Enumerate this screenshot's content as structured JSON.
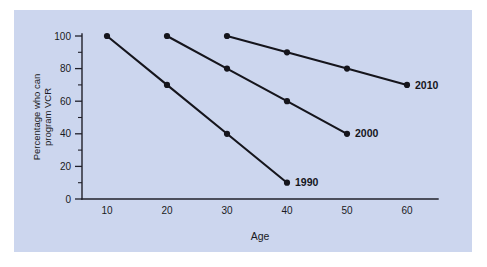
{
  "figure": {
    "panel_color": "#ccd6ee",
    "page_color": "#ffffff",
    "ink_color": "#15151c"
  },
  "chart_data": {
    "type": "line",
    "title": "",
    "xlabel": "Age",
    "ylabel": "Percentage who can program VCR",
    "ylabel_line1": "Percentage who can",
    "ylabel_line2": "program VCR",
    "xlim": [
      0,
      65
    ],
    "ylim": [
      0,
      100
    ],
    "xticks": [
      10,
      20,
      30,
      40,
      50,
      60
    ],
    "xtick_labels": [
      "10",
      "20",
      "30",
      "40",
      "50",
      "60"
    ],
    "yticks": [
      0,
      20,
      40,
      60,
      80,
      100
    ],
    "ytick_labels": [
      "0",
      "20",
      "40",
      "60",
      "80",
      "100"
    ],
    "y_minor_ticks": [
      10,
      30,
      50,
      70,
      90
    ],
    "grid": false,
    "legend_position": "line-end-labels",
    "marker": "filled-circle",
    "series": [
      {
        "name": "1990",
        "label": "1990",
        "x": [
          10,
          20,
          30,
          40
        ],
        "values": [
          100,
          70,
          40,
          10
        ],
        "label_at": {
          "x": 40,
          "y": 10
        }
      },
      {
        "name": "2000",
        "label": "2000",
        "x": [
          20,
          30,
          40,
          50
        ],
        "values": [
          100,
          80,
          60,
          40
        ],
        "label_at": {
          "x": 50,
          "y": 40
        }
      },
      {
        "name": "2010",
        "label": "2010",
        "x": [
          30,
          40,
          50,
          60
        ],
        "values": [
          100,
          90,
          80,
          70
        ],
        "label_at": {
          "x": 60,
          "y": 70
        }
      }
    ]
  }
}
